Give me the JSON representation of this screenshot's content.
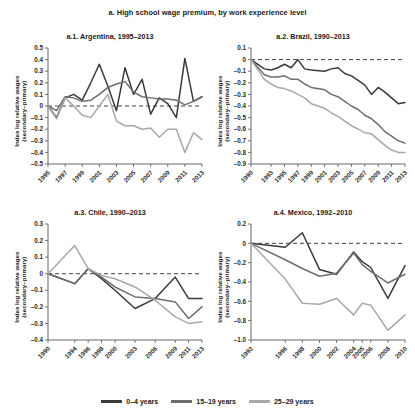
{
  "figure": {
    "title": "a. High school wage premium, by work experience level",
    "ylabel_line1": "Index log relative wages",
    "ylabel_line2": "(secondary–primary)"
  },
  "legend": {
    "position": "bottom-center",
    "items": [
      {
        "label": "0–4 years",
        "color": "#3a3a3a"
      },
      {
        "label": "15–19 years",
        "color": "#6e6e6e"
      },
      {
        "label": "25–29 years",
        "color": "#a8a8a8"
      }
    ]
  },
  "chart_data": [
    {
      "type": "line",
      "panel_id": "a.1",
      "title": "a.1. Argentina, 1995–2013",
      "xlabel": "",
      "ylabel": "Index log relative wages (secondary–primary)",
      "grid": false,
      "zero_reference_line": true,
      "ylim": [
        -0.5,
        0.5
      ],
      "yticks": [
        0.5,
        0.4,
        0.3,
        0.2,
        0.1,
        0,
        -0.1,
        -0.2,
        -0.3,
        -0.4,
        -0.5
      ],
      "ytick_labels": [
        "0.5",
        "0.4",
        "0.3",
        "0.2",
        "0.1",
        "0",
        "–0.1",
        "–0.2",
        "–0.3",
        "–0.4",
        "–0.5"
      ],
      "xticks": [
        1995,
        1997,
        1999,
        2001,
        2003,
        2005,
        2007,
        2009,
        2011,
        2013
      ],
      "xtick_labels": [
        "1995",
        "1997",
        "1999",
        "2001",
        "2003",
        "2005",
        "2007",
        "2009",
        "2011",
        "2013"
      ],
      "xlim": [
        1995,
        2013
      ],
      "x": [
        1995,
        1996,
        1997,
        1998,
        1999,
        2000,
        2001,
        2002,
        2003,
        2004,
        2005,
        2006,
        2007,
        2008,
        2009,
        2010,
        2011,
        2012,
        2013
      ],
      "series": [
        {
          "name": "0–4 years",
          "color": "#3a3a3a",
          "values": [
            0.0,
            -0.1,
            0.07,
            0.1,
            0.05,
            0.2,
            0.36,
            0.17,
            -0.04,
            0.33,
            0.1,
            0.23,
            -0.07,
            0.07,
            0.02,
            -0.1,
            0.41,
            0.04,
            0.08
          ]
        },
        {
          "name": "15–19 years",
          "color": "#6e6e6e",
          "values": [
            0.0,
            -0.04,
            0.08,
            0.07,
            0.04,
            0.05,
            0.1,
            0.16,
            0.19,
            0.21,
            0.12,
            0.08,
            0.07,
            0.06,
            0.06,
            0.05,
            0.01,
            0.04,
            0.08
          ]
        },
        {
          "name": "25–29 years",
          "color": "#a8a8a8",
          "values": [
            0.0,
            -0.11,
            0.07,
            0.0,
            -0.08,
            -0.1,
            0.0,
            0.1,
            -0.13,
            -0.17,
            -0.17,
            -0.2,
            -0.19,
            -0.27,
            -0.2,
            -0.2,
            -0.4,
            -0.23,
            -0.29
          ]
        }
      ]
    },
    {
      "type": "line",
      "panel_id": "a.2",
      "title": "a.2. Brazil, 1990–2013",
      "xlabel": "",
      "ylabel": "Index log relative wages (secondary–primary)",
      "grid": false,
      "zero_reference_line": true,
      "ylim": [
        -0.9,
        0.1
      ],
      "yticks": [
        0.1,
        0,
        -0.1,
        -0.2,
        -0.3,
        -0.4,
        -0.5,
        -0.6,
        -0.7,
        -0.8,
        -0.9
      ],
      "ytick_labels": [
        "0.1",
        "0",
        "–0.1",
        "–0.2",
        "–0.3",
        "–0.4",
        "–0.5",
        "–0.6",
        "–0.7",
        "–0.8",
        "–0.9"
      ],
      "xticks": [
        1990,
        1993,
        1995,
        1997,
        1999,
        2001,
        2003,
        2005,
        2007,
        2009,
        2011,
        2013
      ],
      "xtick_labels": [
        "1990",
        "1993",
        "1995",
        "1997",
        "1999",
        "2001",
        "2003",
        "2005",
        "2007",
        "2009",
        "2011",
        "2013"
      ],
      "xlim": [
        1990,
        2013
      ],
      "x": [
        1990,
        1992,
        1993,
        1994,
        1995,
        1996,
        1997,
        1998,
        1999,
        2001,
        2002,
        2003,
        2004,
        2005,
        2006,
        2007,
        2008,
        2009,
        2010,
        2011,
        2012,
        2013
      ],
      "series": [
        {
          "name": "0–4 years",
          "color": "#3a3a3a",
          "values": [
            0.0,
            -0.08,
            -0.09,
            -0.07,
            -0.04,
            -0.07,
            0.0,
            -0.08,
            -0.09,
            -0.1,
            -0.08,
            -0.07,
            -0.12,
            -0.14,
            -0.18,
            -0.22,
            -0.3,
            -0.24,
            -0.28,
            -0.33,
            -0.38,
            -0.37
          ]
        },
        {
          "name": "15–19 years",
          "color": "#6e6e6e",
          "values": [
            0.0,
            -0.13,
            -0.15,
            -0.15,
            -0.14,
            -0.17,
            -0.17,
            -0.21,
            -0.24,
            -0.26,
            -0.3,
            -0.32,
            -0.36,
            -0.4,
            -0.43,
            -0.48,
            -0.51,
            -0.56,
            -0.62,
            -0.66,
            -0.7,
            -0.72
          ]
        },
        {
          "name": "25–29 years",
          "color": "#a8a8a8",
          "values": [
            0.0,
            -0.17,
            -0.21,
            -0.24,
            -0.25,
            -0.27,
            -0.3,
            -0.33,
            -0.38,
            -0.42,
            -0.46,
            -0.49,
            -0.53,
            -0.57,
            -0.6,
            -0.63,
            -0.64,
            -0.69,
            -0.74,
            -0.78,
            -0.8,
            -0.8
          ]
        }
      ]
    },
    {
      "type": "line",
      "panel_id": "a.3",
      "title": "a.3. Chile, 1990–2013",
      "xlabel": "",
      "ylabel": "Index log relative wages (secondary–primary)",
      "grid": false,
      "zero_reference_line": true,
      "ylim": [
        -0.4,
        0.3
      ],
      "yticks": [
        0.3,
        0.2,
        0.1,
        0,
        -0.1,
        -0.2,
        -0.3,
        -0.4
      ],
      "ytick_labels": [
        "0.3",
        "0.2",
        "0.1",
        "0",
        "–0.1",
        "–0.2",
        "–0.3",
        "–0.4"
      ],
      "xticks": [
        1990,
        1994,
        1996,
        1998,
        2000,
        2003,
        2006,
        2009,
        2011,
        2013
      ],
      "xtick_labels": [
        "1990",
        "1994",
        "1996",
        "1998",
        "2000",
        "2003",
        "2006",
        "2009",
        "2011",
        "2013"
      ],
      "xlim": [
        1990,
        2013
      ],
      "x": [
        1990,
        1994,
        1996,
        1998,
        2000,
        2003,
        2006,
        2009,
        2011,
        2013
      ],
      "series": [
        {
          "name": "0–4 years",
          "color": "#3a3a3a",
          "values": [
            0.0,
            -0.06,
            0.03,
            -0.03,
            -0.1,
            -0.21,
            -0.15,
            -0.02,
            -0.15,
            -0.15
          ]
        },
        {
          "name": "15–19 years",
          "color": "#6e6e6e",
          "values": [
            0.0,
            -0.06,
            0.03,
            -0.02,
            -0.08,
            -0.14,
            -0.15,
            -0.17,
            -0.27,
            -0.2
          ]
        },
        {
          "name": "25–29 years",
          "color": "#a8a8a8",
          "values": [
            0.0,
            0.17,
            0.03,
            -0.01,
            -0.03,
            -0.08,
            -0.16,
            -0.26,
            -0.3,
            -0.29
          ]
        }
      ]
    },
    {
      "type": "line",
      "panel_id": "a.4",
      "title": "a.4. Mexico, 1992–2010",
      "xlabel": "",
      "ylabel": "Index log relative wages (secondary–primary)",
      "grid": false,
      "zero_reference_line": true,
      "ylim": [
        -1.0,
        0.2
      ],
      "yticks": [
        0.2,
        0,
        -0.2,
        -0.4,
        -0.6,
        -0.8,
        -1.0
      ],
      "ytick_labels": [
        "0.2",
        "0",
        "–0.2",
        "–0.4",
        "–0.6",
        "–0.8",
        "–1.0"
      ],
      "xticks": [
        1992,
        1996,
        1998,
        2000,
        2002,
        2004,
        2005,
        2006,
        2008,
        2010
      ],
      "xtick_labels": [
        "1992",
        "1996",
        "1998",
        "2000",
        "2002",
        "2004",
        "2005",
        "2006",
        "2008",
        "2010"
      ],
      "xlim": [
        1992,
        2010
      ],
      "x": [
        1992,
        1996,
        1998,
        2000,
        2002,
        2004,
        2005,
        2006,
        2008,
        2010
      ],
      "series": [
        {
          "name": "0–4 years",
          "color": "#3a3a3a",
          "values": [
            0.0,
            -0.04,
            0.11,
            -0.27,
            -0.32,
            -0.09,
            -0.19,
            -0.25,
            -0.57,
            -0.23
          ]
        },
        {
          "name": "15–19 years",
          "color": "#6e6e6e",
          "values": [
            0.0,
            -0.17,
            -0.26,
            -0.34,
            -0.31,
            -0.1,
            -0.22,
            -0.29,
            -0.41,
            -0.32
          ]
        },
        {
          "name": "25–29 years",
          "color": "#a8a8a8",
          "values": [
            0.0,
            -0.37,
            -0.62,
            -0.63,
            -0.57,
            -0.74,
            -0.62,
            -0.64,
            -0.9,
            -0.74
          ]
        }
      ]
    }
  ]
}
